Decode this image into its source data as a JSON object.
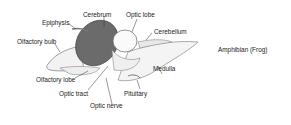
{
  "diagram": {
    "title": "Amphibian (Frog)",
    "labels": {
      "epiphysis": "Epiphysis",
      "cerebrum": "Cerebrum",
      "optic_lobe": "Optic lobe",
      "olfactory_bulb": "Olfactory bulb",
      "cerebellum": "Cerebellum",
      "medulla": "Medulla",
      "olfactory_lobe": "Olfactory lobe",
      "optic_tract": "Optic tract",
      "pituitary": "Pituitary",
      "optic_nerve": "Optic nerve"
    },
    "colors": {
      "cerebrum_fill": "#6b6b6b",
      "outline": "#555555",
      "background": "#ffffff"
    }
  }
}
